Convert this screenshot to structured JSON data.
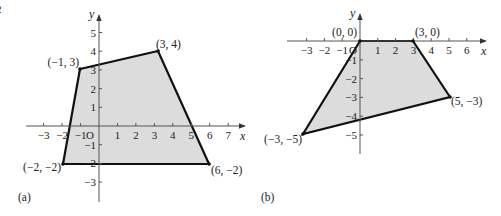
{
  "figure": {
    "corner_fragment": "2",
    "panels": [
      {
        "id": "a",
        "panel_label": "(a)",
        "x_axis_label": "x",
        "y_axis_label": "y",
        "origin_label": "O",
        "x_ticks": [
          "−3",
          "−2",
          "−1",
          "1",
          "2",
          "3",
          "4",
          "5",
          "6",
          "7"
        ],
        "y_ticks": [
          "5",
          "4",
          "3",
          "2",
          "1",
          "−1",
          "−2",
          "−3"
        ],
        "vertices": [
          {
            "x": -1,
            "y": 3,
            "label": "(−1, 3)"
          },
          {
            "x": 3,
            "y": 4,
            "label": "(3, 4)"
          },
          {
            "x": 6,
            "y": -2,
            "label": "(6, −2)"
          },
          {
            "x": -2,
            "y": -2,
            "label": "(−2, −2)"
          }
        ],
        "fill_color": "#dcdcdc",
        "edge_color": "#111111"
      },
      {
        "id": "b",
        "panel_label": "(b)",
        "x_axis_label": "x",
        "y_axis_label": "y",
        "origin_label": "O",
        "x_ticks": [
          "−3",
          "−2",
          "−1",
          "1",
          "2",
          "3",
          "4",
          "5",
          "6"
        ],
        "y_ticks": [
          "−1",
          "−2",
          "−3",
          "−4",
          "−5"
        ],
        "vertices": [
          {
            "x": 0,
            "y": 0,
            "label": "(0, 0)"
          },
          {
            "x": 3,
            "y": 0,
            "label": "(3, 0)"
          },
          {
            "x": 5,
            "y": -3,
            "label": "(5, −3)"
          },
          {
            "x": -3,
            "y": -5,
            "label": "(−3, −5)"
          }
        ],
        "fill_color": "#dcdcdc",
        "edge_color": "#111111"
      }
    ]
  }
}
